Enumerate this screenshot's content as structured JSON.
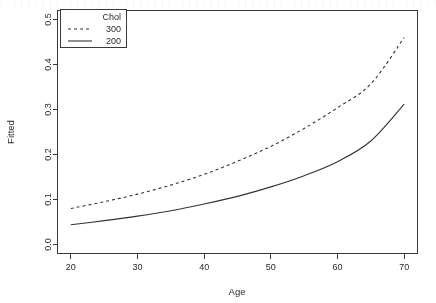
{
  "chart_data": {
    "type": "line",
    "title": "",
    "xlabel": "Age",
    "ylabel": "Fitted",
    "xlim": [
      18,
      72
    ],
    "ylim": [
      -0.02,
      0.52
    ],
    "xticks": [
      20,
      30,
      40,
      50,
      60,
      70
    ],
    "xtick_labels": [
      "20",
      "30",
      "40",
      "50",
      "60",
      "70"
    ],
    "yticks": [
      0.0,
      0.1,
      0.2,
      0.3,
      0.4,
      0.5
    ],
    "ytick_labels": [
      "0.0",
      "0.1",
      "0.2",
      "0.3",
      "0.4",
      "0.5"
    ],
    "grid": false,
    "legend_position": "top-left",
    "legend_title": "Chol",
    "x": [
      20,
      25,
      30,
      35,
      40,
      45,
      50,
      55,
      60,
      65,
      70
    ],
    "series": [
      {
        "name": "300",
        "style": "dashed",
        "color": "#333333",
        "values": [
          0.08,
          0.095,
          0.112,
          0.132,
          0.156,
          0.185,
          0.218,
          0.258,
          0.304,
          0.357,
          0.46
        ]
      },
      {
        "name": "200",
        "style": "solid",
        "color": "#333333",
        "values": [
          0.044,
          0.053,
          0.063,
          0.075,
          0.09,
          0.107,
          0.128,
          0.153,
          0.184,
          0.23,
          0.312
        ]
      }
    ]
  },
  "legend": {
    "title": "Chol",
    "entries": [
      {
        "label": "300",
        "style": "dashed"
      },
      {
        "label": "200",
        "style": "solid"
      }
    ]
  },
  "axes": {
    "x_title": "Age",
    "y_title": "Fitted"
  }
}
